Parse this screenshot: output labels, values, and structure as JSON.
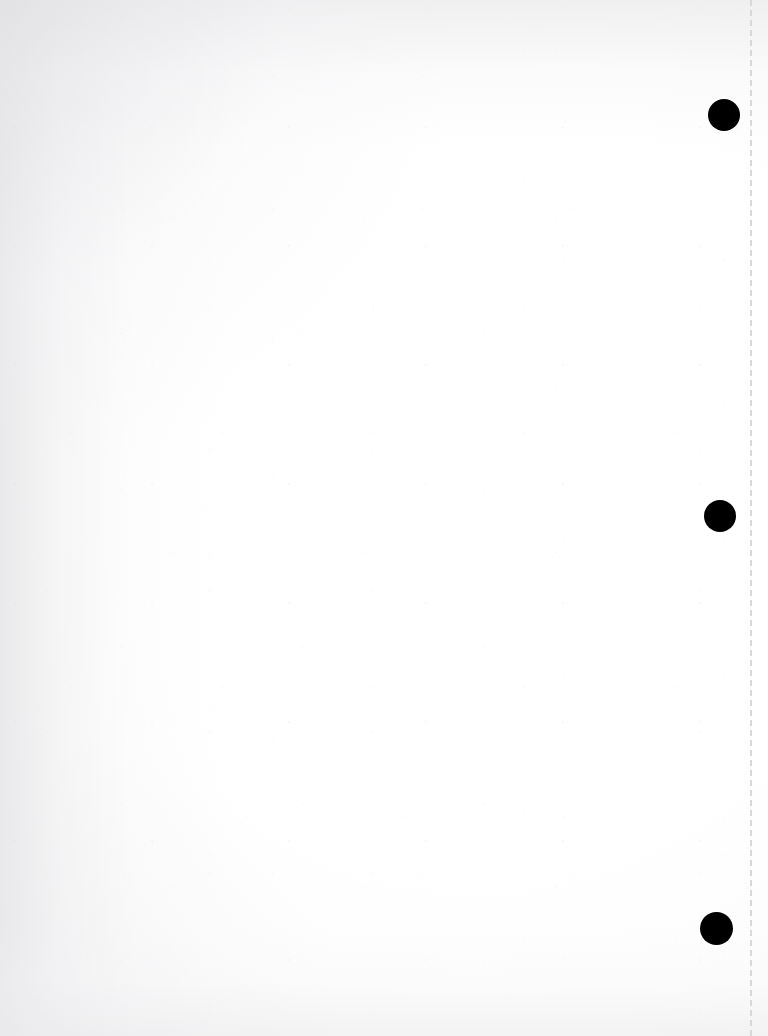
{
  "document": {
    "kind": "scanned-page",
    "title": "Blank scanned notebook page",
    "page_width": 768,
    "page_height": 1036,
    "background_color": "#ffffff",
    "paper_tint": "#f7f7f8",
    "content_text": "",
    "visible_text_present": false,
    "description": "Blank white scanned sheet with three black binder punch holes down the right margin and a light gray dashed perforation rule near the right edge."
  },
  "perforation": {
    "name": "perforation-line",
    "x": 750,
    "top": 0,
    "bottom": 1036,
    "color": "#d8d8da",
    "width_px": 2,
    "style": "dashed",
    "dash_length": 6,
    "dash_gap": 4
  },
  "punch_holes": [
    {
      "label": "top-punch-hole",
      "cx": 724,
      "cy": 115,
      "r": 16.0,
      "color": "#000000"
    },
    {
      "label": "middle-punch-hole",
      "cx": 720,
      "cy": 516,
      "r": 16.0,
      "color": "#000000"
    },
    {
      "label": "bottom-punch-hole",
      "cx": 716,
      "cy": 928,
      "r": 16.5,
      "color": "#000000"
    }
  ],
  "shading": {
    "left_margin_tone": "#e4e4e6",
    "top_edge_tone": "#e7e7e9",
    "bottom_edge_tone": "#ebebed",
    "center_tone": "#ffffff"
  }
}
